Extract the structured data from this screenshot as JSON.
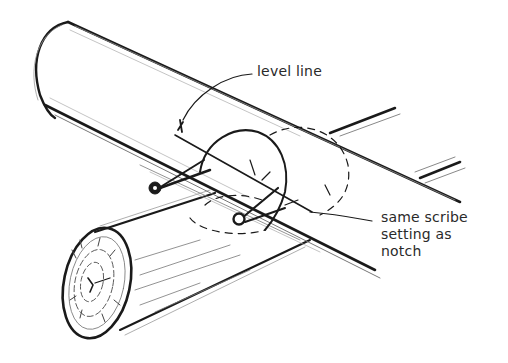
{
  "figure": {
    "style": "pencil-sketch",
    "colors": {
      "ink": "#1a1a1a",
      "faint": "#9a9a9a",
      "background": "#ffffff",
      "text": "#2a2a2a"
    }
  },
  "labels": {
    "level_line": "level line",
    "scribe_line1": "same scribe",
    "scribe_line2": "setting as",
    "scribe_line3": "notch"
  },
  "elements": {
    "upper_log": "upper-log",
    "lower_log": "lower-log",
    "scribe_tool_left": "scribe-tool",
    "scribe_tool_right": "scribe-tool",
    "notch_outline": "notch-outline",
    "hidden_notch": "dashed-hidden-notch",
    "log_end_rings": "log-end-grain"
  }
}
